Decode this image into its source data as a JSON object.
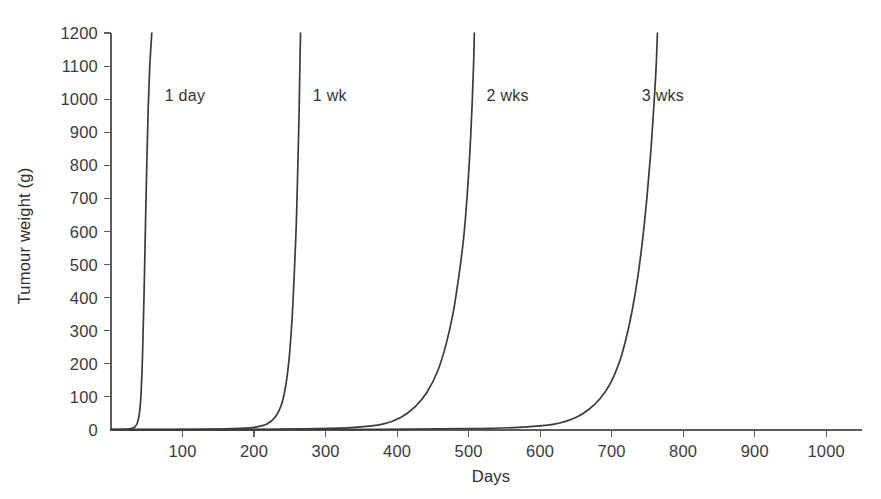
{
  "chart_data": {
    "type": "line",
    "title": "",
    "xlabel": "Days",
    "ylabel": "Tumour weight (g)",
    "xlim": [
      0,
      1050
    ],
    "ylim": [
      0,
      1200
    ],
    "grid": false,
    "legend_position": "inline-curve-labels",
    "x_ticks": [
      100,
      200,
      300,
      400,
      500,
      600,
      700,
      800,
      900,
      1000
    ],
    "x_tick_labels": [
      "100",
      "200",
      "300",
      "400",
      "500",
      "600",
      "700",
      "800",
      "900",
      "1000"
    ],
    "y_ticks": [
      0,
      100,
      200,
      300,
      400,
      500,
      600,
      700,
      800,
      900,
      1000,
      1100,
      1200
    ],
    "y_tick_labels": [
      "0",
      "100",
      "200",
      "300",
      "400",
      "500",
      "600",
      "700",
      "800",
      "900",
      "1000",
      "1100",
      "1200"
    ],
    "annotations": [
      {
        "text": "1 day",
        "x": 75,
        "y": 1010
      },
      {
        "text": "1 wk",
        "x": 282,
        "y": 1010
      },
      {
        "text": "2 wks",
        "x": 525,
        "y": 1010
      },
      {
        "text": "3 wks",
        "x": 742,
        "y": 1010
      }
    ],
    "series": [
      {
        "name": "1 day",
        "label": "1 day",
        "takeoff_day": 30,
        "reaches_1200_day": 57,
        "color": "#3b3b3b",
        "points": [
          [
            0,
            1
          ],
          [
            10,
            1
          ],
          [
            20,
            2
          ],
          [
            28,
            4
          ],
          [
            33,
            9
          ],
          [
            37,
            22
          ],
          [
            40,
            55
          ],
          [
            42,
            110
          ],
          [
            44,
            220
          ],
          [
            46,
            390
          ],
          [
            48,
            600
          ],
          [
            50,
            800
          ],
          [
            52,
            970
          ],
          [
            54,
            1090
          ],
          [
            56,
            1165
          ],
          [
            57,
            1200
          ]
        ]
      },
      {
        "name": "1 wk",
        "label": "1 wk",
        "takeoff_day": 230,
        "reaches_1200_day": 264,
        "color": "#3b3b3b",
        "points": [
          [
            0,
            1
          ],
          [
            60,
            1
          ],
          [
            120,
            2
          ],
          [
            170,
            4
          ],
          [
            200,
            8
          ],
          [
            218,
            18
          ],
          [
            230,
            40
          ],
          [
            238,
            75
          ],
          [
            244,
            130
          ],
          [
            249,
            215
          ],
          [
            253,
            330
          ],
          [
            256,
            460
          ],
          [
            259,
            620
          ],
          [
            261,
            780
          ],
          [
            263,
            960
          ],
          [
            264,
            1090
          ],
          [
            265,
            1200
          ]
        ]
      },
      {
        "name": "2 wks",
        "label": "2 wks",
        "takeoff_day": 400,
        "reaches_1200_day": 507,
        "color": "#3b3b3b",
        "points": [
          [
            0,
            1
          ],
          [
            100,
            1
          ],
          [
            200,
            2
          ],
          [
            290,
            4
          ],
          [
            340,
            8
          ],
          [
            380,
            18
          ],
          [
            405,
            38
          ],
          [
            425,
            70
          ],
          [
            442,
            115
          ],
          [
            457,
            180
          ],
          [
            468,
            255
          ],
          [
            478,
            350
          ],
          [
            486,
            460
          ],
          [
            493,
            580
          ],
          [
            498,
            710
          ],
          [
            502,
            850
          ],
          [
            505,
            990
          ],
          [
            507,
            1110
          ],
          [
            508,
            1200
          ]
        ]
      },
      {
        "name": "3 wks",
        "label": "3 wks",
        "takeoff_day": 640,
        "reaches_1200_day": 726,
        "color": "#3b3b3b",
        "points": [
          [
            0,
            1
          ],
          [
            200,
            1
          ],
          [
            380,
            2
          ],
          [
            500,
            4
          ],
          [
            570,
            8
          ],
          [
            620,
            18
          ],
          [
            650,
            38
          ],
          [
            668,
            62
          ],
          [
            684,
            95
          ],
          [
            698,
            140
          ],
          [
            710,
            200
          ],
          [
            720,
            275
          ],
          [
            729,
            365
          ],
          [
            737,
            470
          ],
          [
            744,
            590
          ],
          [
            750,
            720
          ],
          [
            755,
            850
          ],
          [
            759,
            980
          ],
          [
            762,
            1090
          ],
          [
            764,
            1200
          ]
        ]
      }
    ]
  }
}
